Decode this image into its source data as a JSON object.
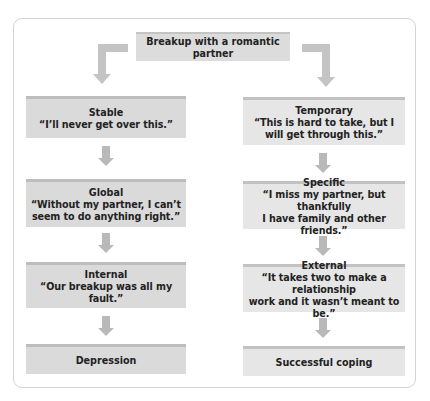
{
  "diagram": {
    "root": {
      "label": "Breakup with a romantic partner"
    },
    "left_branch": {
      "steps": [
        {
          "title": "Stable",
          "quote": "“I’ll never get over this.”"
        },
        {
          "title": "Global",
          "quote_line1": "“Without my partner, I can’t",
          "quote_line2": "seem to do anything right.”"
        },
        {
          "title": "Internal",
          "quote": "“Our breakup was all my fault.”"
        }
      ],
      "outcome": "Depression"
    },
    "right_branch": {
      "steps": [
        {
          "title": "Temporary",
          "quote_line1": "“This is hard to take, but I",
          "quote_line2": "will get through this.”"
        },
        {
          "title": "Specific",
          "quote_line1": "“I miss my partner, but thankfully",
          "quote_line2": "I have family and other friends.”"
        },
        {
          "title": "External",
          "quote_line1": "“It takes two to make a relationship",
          "quote_line2": "work and it wasn’t meant to be.”"
        }
      ],
      "outcome": "Successful coping"
    },
    "colors": {
      "left_box": "#dadada",
      "right_box": "#e6e6e6",
      "arrow": "#b9b9b9",
      "panel_border": "#d4d4d4"
    }
  }
}
